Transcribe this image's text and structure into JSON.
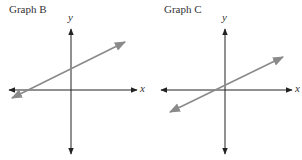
{
  "graphs": [
    {
      "title": "Graph B",
      "x_axis_label": "x",
      "y_axis_label": "y",
      "line_color": "#8a8a8a",
      "axis_color": "#222222",
      "line": {
        "description": "Line with positive slope, y-intercept above origin, x-intercept left of origin",
        "slope_sign": "positive",
        "y_intercept": "positive",
        "x_intercept": "negative"
      }
    },
    {
      "title": "Graph C",
      "x_axis_label": "x",
      "y_axis_label": "y",
      "line_color": "#8a8a8a",
      "axis_color": "#222222",
      "line": {
        "description": "Line with positive slope, y-intercept slightly above origin, x-intercept slightly left of origin",
        "slope_sign": "positive",
        "y_intercept": "small positive",
        "x_intercept": "small negative"
      }
    }
  ]
}
